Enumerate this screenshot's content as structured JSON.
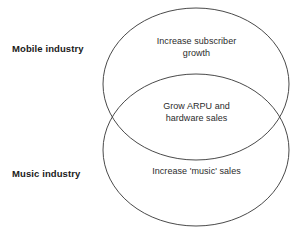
{
  "diagram": {
    "type": "venn",
    "title": "",
    "stroke_color": "#4a4a4a",
    "text_color": "#2b2b2b",
    "label_color": "#1a1a1a",
    "background_color": "#ffffff",
    "sets": [
      {
        "id": "mobile",
        "side_label": "Mobile industry",
        "content": "Increase subscriber\ngrowth",
        "ellipse": {
          "cx": 196,
          "cy": 84,
          "rx": 93,
          "ry": 76
        }
      },
      {
        "id": "music",
        "side_label": "Music industry",
        "content": "Increase 'music' sales",
        "ellipse": {
          "cx": 196,
          "cy": 150,
          "rx": 93,
          "ry": 76
        }
      }
    ],
    "intersection": {
      "id": "mobile-music-overlap",
      "content": "Grow ARPU and\nhardware sales"
    }
  }
}
